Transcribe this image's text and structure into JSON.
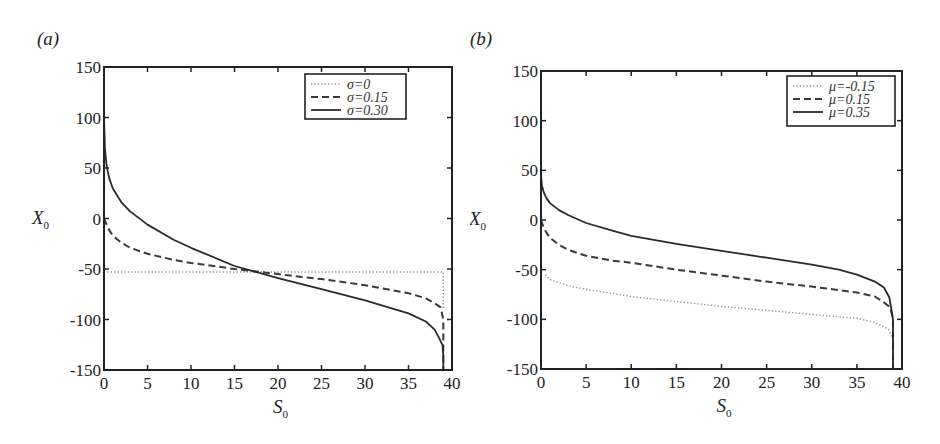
{
  "chart_data": [
    {
      "panel_label": "(a)",
      "type": "line",
      "xlabel": "S",
      "xlabel_sub": "0",
      "ylabel": "X",
      "ylabel_sub": "0",
      "xlim": [
        0,
        40
      ],
      "ylim": [
        -150,
        150
      ],
      "xticks": [
        "0",
        "5",
        "10",
        "15",
        "20",
        "25",
        "30",
        "35",
        "40"
      ],
      "yticks": [
        "150",
        "100",
        "50",
        "0",
        "-50",
        "-100",
        "-150"
      ],
      "grid": false,
      "legend_position": "upper right",
      "series": [
        {
          "name": "σ=0",
          "style": "dotted",
          "x": [
            0,
            5,
            10,
            15,
            20,
            25,
            30,
            35,
            38.5,
            39,
            39
          ],
          "y": [
            -53,
            -53,
            -53,
            -53,
            -53,
            -53,
            -53,
            -53,
            -53,
            -53,
            -90
          ]
        },
        {
          "name": "σ=0.15",
          "style": "dashed",
          "x": [
            0,
            0.5,
            1,
            2,
            3,
            5,
            8,
            10,
            15,
            20,
            25,
            30,
            35,
            37,
            38,
            38.7,
            39,
            39
          ],
          "y": [
            0,
            -10,
            -17,
            -24,
            -29,
            -35,
            -41,
            -44,
            -50,
            -55,
            -60,
            -66,
            -74,
            -79,
            -84,
            -88,
            -100,
            -150
          ]
        },
        {
          "name": "σ=0.30",
          "style": "solid",
          "x": [
            0,
            0.1,
            0.3,
            0.6,
            1,
            2,
            3,
            5,
            8,
            10,
            15,
            20,
            25,
            30,
            35,
            37,
            38,
            38.5,
            38.9,
            39,
            39
          ],
          "y": [
            100,
            70,
            52,
            40,
            30,
            16,
            7,
            -6,
            -21,
            -29,
            -47,
            -59,
            -70,
            -81,
            -94,
            -102,
            -110,
            -118,
            -125,
            -135,
            -150
          ]
        }
      ]
    },
    {
      "panel_label": "(b)",
      "type": "line",
      "xlabel": "S",
      "xlabel_sub": "0",
      "ylabel": "X",
      "ylabel_sub": "0",
      "xlim": [
        0,
        40
      ],
      "ylim": [
        -150,
        150
      ],
      "xticks": [
        "0",
        "5",
        "10",
        "15",
        "20",
        "25",
        "30",
        "35",
        "40"
      ],
      "yticks": [
        "150",
        "100",
        "50",
        "0",
        "-50",
        "-100",
        "-150"
      ],
      "grid": false,
      "legend_position": "upper right",
      "series": [
        {
          "name": "μ=-0.15",
          "style": "dotted",
          "x": [
            0.5,
            1,
            3,
            5,
            8,
            10,
            15,
            20,
            25,
            30,
            35,
            37,
            38.5,
            39,
            39
          ],
          "y": [
            -55,
            -60,
            -66,
            -70,
            -74,
            -77,
            -82,
            -87,
            -91,
            -95,
            -99,
            -103,
            -110,
            -120,
            -150
          ]
        },
        {
          "name": "μ=0.15",
          "style": "dashed",
          "x": [
            0,
            0.3,
            0.7,
            1,
            2,
            3,
            5,
            8,
            10,
            15,
            20,
            25,
            30,
            35,
            37,
            38,
            38.7,
            39,
            39
          ],
          "y": [
            0,
            -8,
            -14,
            -18,
            -25,
            -30,
            -36,
            -41,
            -43,
            -50,
            -56,
            -62,
            -67,
            -73,
            -77,
            -83,
            -88,
            -100,
            -150
          ]
        },
        {
          "name": "μ=0.35",
          "style": "solid",
          "x": [
            0,
            0.1,
            0.3,
            0.6,
            1,
            2,
            3,
            5,
            8,
            10,
            15,
            20,
            25,
            30,
            33,
            35,
            37,
            38,
            38.6,
            39,
            39
          ],
          "y": [
            45,
            35,
            28,
            22,
            17,
            10,
            5,
            -3,
            -11,
            -16,
            -24,
            -31,
            -38,
            -45,
            -50,
            -55,
            -62,
            -68,
            -78,
            -100,
            -150
          ]
        }
      ]
    }
  ]
}
